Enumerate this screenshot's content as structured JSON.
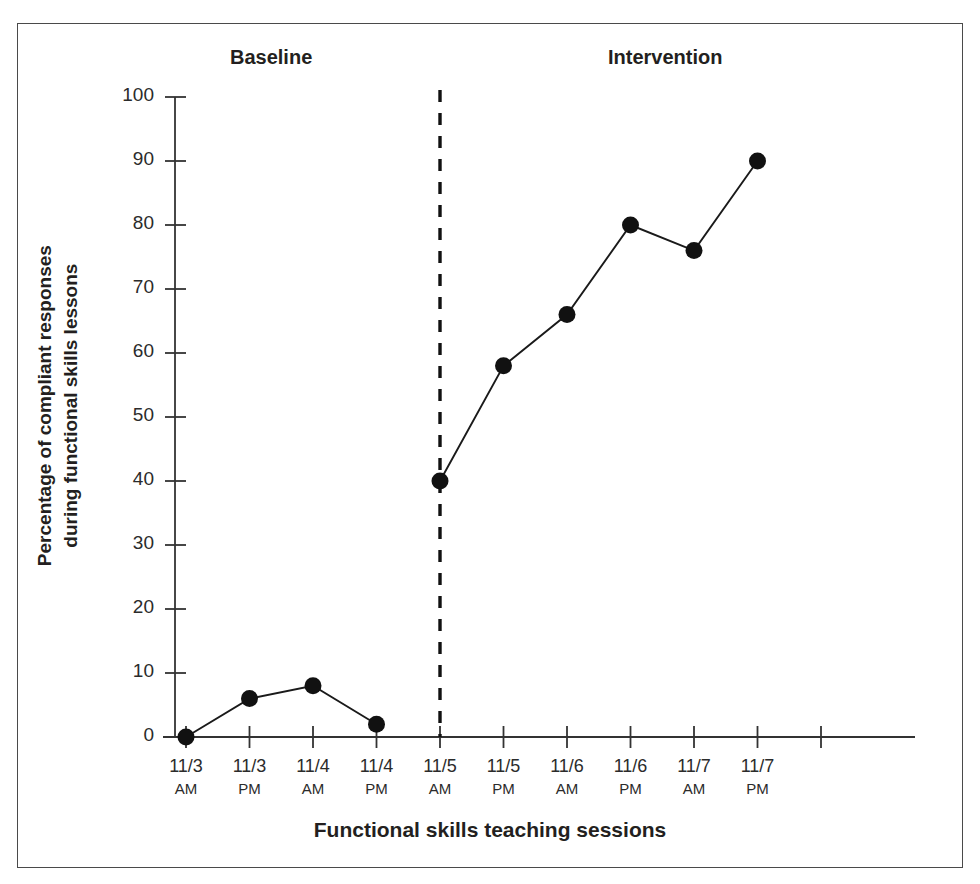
{
  "figure": {
    "axis_color": "#333333",
    "line_color": "#1a1a1a",
    "marker_color": "#111111",
    "border_color": "#4a4a4a"
  },
  "chart_data": {
    "type": "line",
    "title": "",
    "xlabel": "Functional skills teaching sessions",
    "ylabel_line1": "Percentage of compliant responses",
    "ylabel_line2": "during functional skills lessons",
    "ylim": [
      0,
      100
    ],
    "ytick_values": [
      0,
      10,
      20,
      30,
      40,
      50,
      60,
      70,
      80,
      90,
      100
    ],
    "ytick_labels": [
      "0",
      "10",
      "20",
      "30",
      "40",
      "50",
      "60",
      "70",
      "80",
      "90",
      "100"
    ],
    "grid": false,
    "legend_position": "none",
    "categories": [
      "11/3 AM",
      "11/3 PM",
      "11/4 AM",
      "11/4 PM",
      "11/5 AM",
      "11/5 PM",
      "11/6 AM",
      "11/6 PM",
      "11/7 AM",
      "11/7 PM"
    ],
    "xtick_dates": [
      "11/3",
      "11/3",
      "11/4",
      "11/4",
      "11/5",
      "11/5",
      "11/6",
      "11/6",
      "11/7",
      "11/7"
    ],
    "xtick_times": [
      "AM",
      "PM",
      "AM",
      "PM",
      "AM",
      "PM",
      "AM",
      "PM",
      "AM",
      "PM"
    ],
    "series": [
      {
        "name": "Baseline",
        "phase": "baseline",
        "x": [
          "11/3 AM",
          "11/3 PM",
          "11/4 AM",
          "11/4 PM"
        ],
        "values": [
          0,
          6,
          8,
          2
        ]
      },
      {
        "name": "Intervention",
        "phase": "intervention",
        "x": [
          "11/5 AM",
          "11/5 PM",
          "11/6 AM",
          "11/6 PM",
          "11/7 AM",
          "11/7 PM"
        ],
        "values": [
          40,
          58,
          66,
          80,
          76,
          90
        ]
      }
    ],
    "annotations": [
      {
        "type": "phase-label",
        "text": "Baseline",
        "position": "top-left"
      },
      {
        "type": "phase-label",
        "text": "Intervention",
        "position": "top-right"
      },
      {
        "type": "phase-change-line",
        "style": "dashed",
        "between": [
          "11/4 PM",
          "11/5 AM"
        ]
      }
    ]
  }
}
